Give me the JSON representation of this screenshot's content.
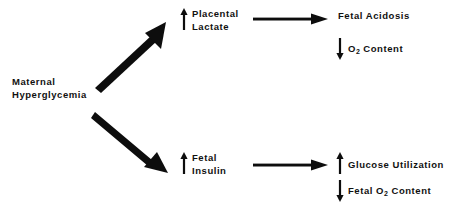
{
  "diagram": {
    "background_color": "#ffffff",
    "ink_color": "#0d0d0d",
    "nodes": {
      "source": {
        "id": "maternal-hyperglycemia",
        "line1": "Maternal",
        "line2": "Hyperglycemia"
      },
      "upper_mid": {
        "id": "placental-lactate",
        "change": "increase",
        "change_glyph": "up-arrow",
        "line1": "Placental",
        "line2": "Lactate"
      },
      "lower_mid": {
        "id": "fetal-insulin",
        "change": "increase",
        "change_glyph": "up-arrow",
        "line1": "Fetal",
        "line2": "Insulin"
      },
      "upper_right_1": {
        "id": "fetal-acidosis",
        "change": "none",
        "text": "Fetal Acidosis"
      },
      "upper_right_2": {
        "id": "o2-content",
        "change": "decrease",
        "change_glyph": "down-arrow",
        "text_before": "O",
        "subscript": "2",
        "text_after": "Content"
      },
      "lower_right_1": {
        "id": "glucose-utilization",
        "change": "increase",
        "change_glyph": "up-arrow",
        "text": "Glucose Utilization"
      },
      "lower_right_2": {
        "id": "fetal-o2-content",
        "change": "decrease",
        "change_glyph": "down-arrow",
        "text_before": "Fetal O",
        "subscript": "2",
        "text_after": "Content"
      }
    },
    "edges": [
      {
        "id": "edge-source-to-placental-lactate",
        "from": "maternal-hyperglycemia",
        "to": "placental-lactate",
        "style": "thick-diagonal-up"
      },
      {
        "id": "edge-source-to-fetal-insulin",
        "from": "maternal-hyperglycemia",
        "to": "fetal-insulin",
        "style": "thick-diagonal-down"
      },
      {
        "id": "edge-placental-lactate-to-fetal-acidosis",
        "from": "placental-lactate",
        "to": "fetal-acidosis",
        "style": "horizontal"
      },
      {
        "id": "edge-fetal-insulin-to-glucose-utilization",
        "from": "fetal-insulin",
        "to": "glucose-utilization",
        "style": "horizontal"
      }
    ]
  }
}
